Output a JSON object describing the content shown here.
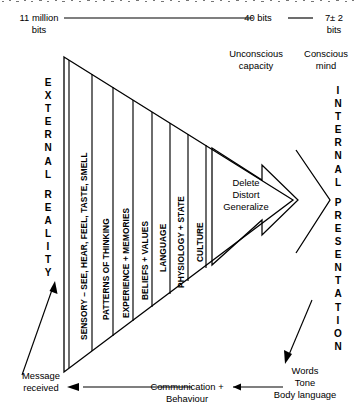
{
  "diagram": {
    "top_scale": {
      "left_value": "11 million\nbits",
      "left_value_line1": "11 million",
      "left_value_line2": "bits",
      "mid_value": "40 bits",
      "right_value_line1": "7± 2",
      "right_value_line2": "bits"
    },
    "capacity_labels": {
      "unconscious_line1": "Unconscious",
      "unconscious_line2": "capacity",
      "conscious_line1": "Conscious",
      "conscious_line2": "mind"
    },
    "left_axis": {
      "word1": "EXTERNAL",
      "word2": "REALITY",
      "letters": [
        "E",
        "X",
        "T",
        "E",
        "R",
        "N",
        "A",
        "L",
        "",
        "R",
        "E",
        "A",
        "L",
        "I",
        "T",
        "Y"
      ]
    },
    "right_axis": {
      "word1": "INTERNAL",
      "word2": "PRESENTATION",
      "letters": [
        "I",
        "N",
        "T",
        "E",
        "R",
        "N",
        "A",
        "L",
        "",
        "P",
        "R",
        "E",
        "S",
        "E",
        "N",
        "T",
        "A",
        "T",
        "I",
        "O",
        "N"
      ]
    },
    "filters": [
      {
        "label": "SENSORY – SEE, HEAR, FEEL, TASTE, SMELL"
      },
      {
        "label": "PATTERNS OF THINKING"
      },
      {
        "label": "EXPERIENCE + MEMORIES"
      },
      {
        "label": "BELIEFS + VALUES"
      },
      {
        "label": "LANGUAGE"
      },
      {
        "label": "PHYSIOLOGY + STATE"
      },
      {
        "label": "CULTURE"
      }
    ],
    "processes": {
      "line1": "Delete",
      "line2": "Distort",
      "line3": "Generalize"
    },
    "bottom": {
      "message_line1": "Message",
      "message_line2": "received",
      "channel_line1": "Communication +",
      "channel_line2": "Behaviour",
      "output_line1": "Words",
      "output_line2": "Tone",
      "output_line3": "Body language"
    },
    "colors": {
      "stroke": "#000000",
      "background": "#ffffff",
      "text": "#000000"
    }
  }
}
